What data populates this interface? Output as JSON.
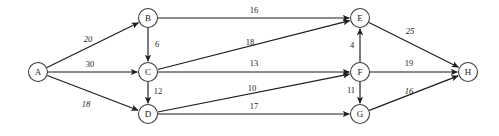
{
  "diagram": {
    "type": "directed-weighted-graph",
    "background_color": "#ffffff",
    "edge_color": "#1c1c1c",
    "node_fill": "#ffffff",
    "node_stroke": "#3a3a3a",
    "label_color": "#242424"
  },
  "nodes": [
    {
      "id": "A",
      "label": "A",
      "x": 38,
      "y": 72,
      "r": 9.5
    },
    {
      "id": "B",
      "label": "B",
      "x": 148,
      "y": 18,
      "r": 9.5
    },
    {
      "id": "C",
      "label": "C",
      "x": 148,
      "y": 72,
      "r": 9.5
    },
    {
      "id": "D",
      "label": "D",
      "x": 148,
      "y": 114,
      "r": 9.5
    },
    {
      "id": "E",
      "label": "E",
      "x": 360,
      "y": 18,
      "r": 9.5
    },
    {
      "id": "F",
      "label": "F",
      "x": 360,
      "y": 72,
      "r": 9.5
    },
    {
      "id": "G",
      "label": "G",
      "x": 360,
      "y": 114,
      "r": 9.5
    },
    {
      "id": "H",
      "label": "H",
      "x": 468,
      "y": 72,
      "r": 9.5
    }
  ],
  "edges": [
    {
      "id": "A-B",
      "from": "A",
      "to": "B",
      "weight": "20",
      "label_x": 88,
      "label_y": 40,
      "italic": true
    },
    {
      "id": "A-C",
      "from": "A",
      "to": "C",
      "weight": "30",
      "label_x": 90,
      "label_y": 65,
      "italic": false
    },
    {
      "id": "A-D",
      "from": "A",
      "to": "D",
      "weight": "18",
      "label_x": 86,
      "label_y": 105,
      "italic": true
    },
    {
      "id": "B-C",
      "from": "B",
      "to": "C",
      "weight": "6",
      "label_x": 157,
      "label_y": 45,
      "italic": false
    },
    {
      "id": "B-E",
      "from": "B",
      "to": "E",
      "weight": "16",
      "label_x": 254,
      "label_y": 11,
      "italic": false
    },
    {
      "id": "C-E",
      "from": "C",
      "to": "E",
      "weight": "18",
      "label_x": 250,
      "label_y": 43,
      "italic": false
    },
    {
      "id": "C-F",
      "from": "C",
      "to": "F",
      "weight": "13",
      "label_x": 254,
      "label_y": 64,
      "italic": false
    },
    {
      "id": "C-D",
      "from": "C",
      "to": "D",
      "weight": "12",
      "label_x": 158,
      "label_y": 92,
      "italic": false
    },
    {
      "id": "D-F",
      "from": "D",
      "to": "F",
      "weight": "10",
      "label_x": 252,
      "label_y": 89,
      "italic": false
    },
    {
      "id": "D-G",
      "from": "D",
      "to": "G",
      "weight": "17",
      "label_x": 254,
      "label_y": 107,
      "italic": false
    },
    {
      "id": "F-E",
      "from": "F",
      "to": "E",
      "weight": "4",
      "label_x": 352,
      "label_y": 46,
      "italic": false
    },
    {
      "id": "F-G",
      "from": "F",
      "to": "G",
      "weight": "11",
      "label_x": 351,
      "label_y": 91,
      "italic": false
    },
    {
      "id": "E-H",
      "from": "E",
      "to": "H",
      "weight": "25",
      "label_x": 410,
      "label_y": 32,
      "italic": true
    },
    {
      "id": "F-H",
      "from": "F",
      "to": "H",
      "weight": "19",
      "label_x": 409,
      "label_y": 64,
      "italic": false
    },
    {
      "id": "G-H",
      "from": "G",
      "to": "H",
      "weight": "16",
      "label_x": 409,
      "label_y": 92,
      "italic": true
    }
  ]
}
